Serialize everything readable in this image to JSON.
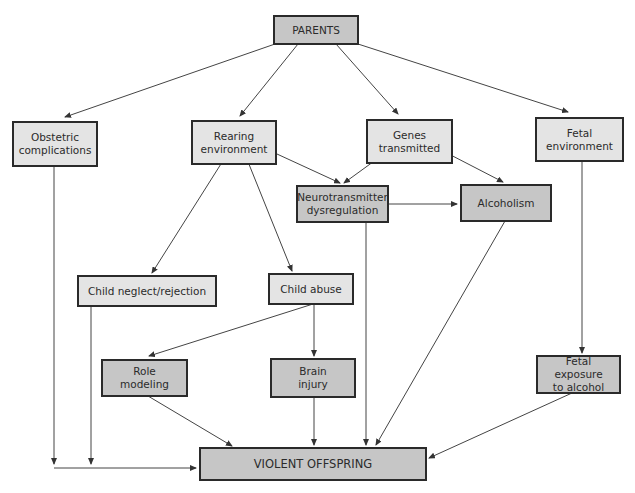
{
  "diagram": {
    "nodes": {
      "parents": {
        "label": "PARENTS"
      },
      "obstetric": {
        "label": "Obstetric\ncomplications"
      },
      "rearing": {
        "label": "Rearing\nenvironment"
      },
      "genes": {
        "label": "Genes\ntransmitted"
      },
      "fetal_env": {
        "label": "Fetal\nenvironment"
      },
      "neuro": {
        "label": "Neurotransmitter\ndysregulation"
      },
      "alcoholism": {
        "label": "Alcoholism"
      },
      "neglect": {
        "label": "Child neglect/rejection"
      },
      "abuse": {
        "label": "Child abuse"
      },
      "role": {
        "label": "Role\nmodeling"
      },
      "brain": {
        "label": "Brain\ninjury"
      },
      "fetal_exposure": {
        "label": "Fetal exposure\nto alcohol"
      },
      "violent": {
        "label": "VIOLENT OFFSPRING"
      }
    },
    "edges": [
      [
        "parents",
        "obstetric"
      ],
      [
        "parents",
        "rearing"
      ],
      [
        "parents",
        "genes"
      ],
      [
        "parents",
        "fetal_env"
      ],
      [
        "rearing",
        "neglect"
      ],
      [
        "rearing",
        "abuse"
      ],
      [
        "rearing",
        "neuro"
      ],
      [
        "genes",
        "neuro"
      ],
      [
        "genes",
        "alcoholism"
      ],
      [
        "neuro",
        "alcoholism"
      ],
      [
        "neuro",
        "violent"
      ],
      [
        "alcoholism",
        "violent"
      ],
      [
        "fetal_env",
        "fetal_exposure"
      ],
      [
        "fetal_exposure",
        "violent"
      ],
      [
        "abuse",
        "role"
      ],
      [
        "abuse",
        "brain"
      ],
      [
        "role",
        "violent"
      ],
      [
        "brain",
        "violent"
      ],
      [
        "obstetric",
        "violent"
      ],
      [
        "neglect",
        "violent"
      ]
    ],
    "colors": {
      "light_fill": "#e4e4e4",
      "dark_fill": "#c6c6c6",
      "stroke": "#2a2a2a"
    }
  }
}
